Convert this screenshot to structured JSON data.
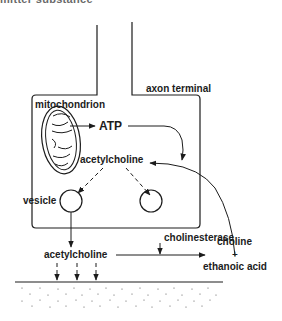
{
  "figure": {
    "clipped_title": "mitter substance",
    "labels": {
      "axon_terminal": "axon terminal",
      "mitochondrion": "mitochondrion",
      "atp": "ATP",
      "acetylcholine_inside": "acetylcholine",
      "vesicle": "vesicle",
      "acetylcholine_cleft": "acetylcholine",
      "cholinesterase": "cholinesterase",
      "choline": "choline",
      "plus": "+",
      "ethanoic_acid": "ethanoic acid"
    },
    "colors": {
      "ink": "#1c1c1c",
      "background": "#ffffff"
    }
  }
}
